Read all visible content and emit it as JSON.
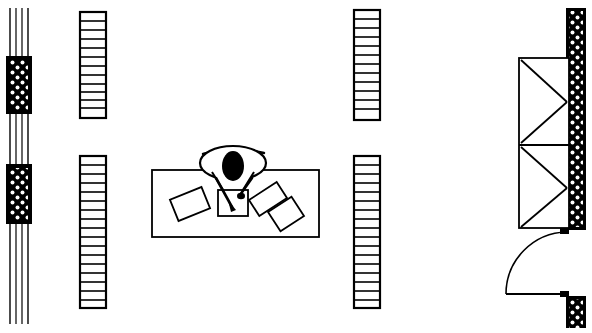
{
  "drawing": {
    "title": "Architectural Floor Plan - Office Workstation",
    "type": "plan-view-line-drawing",
    "width": 592,
    "height": 333,
    "background_color": "#ffffff",
    "line_color": "#000000",
    "hatch_fill_color": "#000000",
    "hatch_dot_color": "#ffffff"
  },
  "elements": {
    "left_wall": {
      "name": "Left cavity wall assembly",
      "x": 9,
      "y": 8,
      "width": 24,
      "height": 316,
      "line_offsets": [
        0,
        6,
        12,
        18
      ],
      "piers": [
        {
          "label": "Upper masonry pier",
          "y": 56,
          "height": 58
        },
        {
          "label": "Lower masonry pier",
          "y": 164,
          "height": 60
        }
      ]
    },
    "partitions": [
      {
        "name": "Partition A upper",
        "id": "partition-upper-left",
        "x": 80,
        "y": 12,
        "width": 26,
        "height": 106,
        "cells": 12
      },
      {
        "name": "Partition A lower",
        "id": "partition-lower-left",
        "x": 80,
        "y": 156,
        "width": 26,
        "height": 152,
        "cells": 17
      },
      {
        "name": "Partition B upper",
        "id": "partition-upper-right",
        "x": 354,
        "y": 10,
        "width": 26,
        "height": 110,
        "cells": 12
      },
      {
        "name": "Partition B lower",
        "id": "partition-lower-right",
        "x": 354,
        "y": 156,
        "width": 26,
        "height": 152,
        "cells": 17
      }
    ],
    "workstation": {
      "name": "Desk with seated occupant",
      "desk": {
        "x": 152,
        "y": 170,
        "width": 167,
        "height": 67
      },
      "occupant": {
        "label": "Person seated, plan view",
        "chair_back_arc": {
          "cx": 233,
          "cy": 152,
          "rx": 32,
          "ry": 7
        },
        "shoulders": {
          "cx": 233,
          "cy": 163,
          "rx": 33,
          "ry": 17
        },
        "head": {
          "cx": 233,
          "cy": 166,
          "rx": 11,
          "ry": 15
        }
      },
      "papers": [
        {
          "label": "Paper left",
          "cx": 190,
          "cy": 204,
          "w": 34,
          "h": 23,
          "rotation": -22
        },
        {
          "label": "Paper center under hands",
          "cx": 233,
          "cy": 203,
          "w": 30,
          "h": 26,
          "rotation": 0
        },
        {
          "label": "Paper right upper",
          "cx": 268,
          "cy": 199,
          "w": 33,
          "h": 19,
          "rotation": -33
        },
        {
          "label": "Paper right lower",
          "cx": 285,
          "cy": 213,
          "w": 28,
          "h": 23,
          "rotation": -33
        }
      ]
    },
    "stair": {
      "name": "Stair / braced structure",
      "x": 519,
      "y": 58,
      "width": 50,
      "height": 170,
      "landing_y": 145,
      "bracing": "double-zigzag"
    },
    "right_wall": {
      "name": "Right masonry wall",
      "segments": [
        {
          "label": "Upper wall segment",
          "x": 566,
          "y": 8,
          "width": 20,
          "height": 222
        },
        {
          "label": "Lower wall segment",
          "x": 566,
          "y": 296,
          "width": 20,
          "height": 32
        }
      ]
    },
    "door": {
      "name": "Hinged door with swing arc",
      "leaf": {
        "x1": 567,
        "y1": 231,
        "x2": 567,
        "y2": 294
      },
      "jamb_top": {
        "x": 561,
        "y": 228,
        "width": 8,
        "height": 6
      },
      "jamb_bottom": {
        "x": 561,
        "y": 291,
        "width": 8,
        "height": 6
      },
      "swing_radius": 62,
      "hinge_x": 567,
      "hinge_y": 231,
      "swing_direction": "counter-clockwise"
    }
  }
}
